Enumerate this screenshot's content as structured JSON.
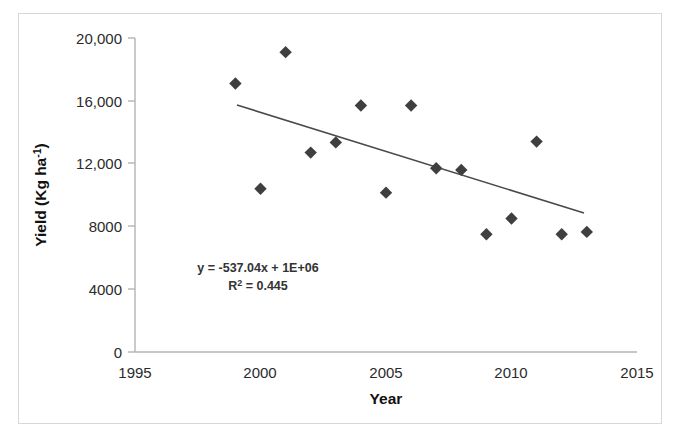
{
  "chart_data": {
    "type": "scatter",
    "title": "",
    "xlabel": "Year",
    "ylabel": "Yield (Kg ha-1)",
    "ylabel_base": "Yield (Kg ha",
    "ylabel_sup": "-1",
    "ylabel_tail": ")",
    "xlim": [
      1995,
      2015
    ],
    "ylim": [
      0,
      20000
    ],
    "xticks": [
      1995,
      2000,
      2005,
      2010,
      2015
    ],
    "xtick_labels": [
      "1995",
      "2000",
      "2005",
      "2010",
      "2015"
    ],
    "yticks": [
      0,
      4000,
      8000,
      12000,
      16000,
      20000
    ],
    "ytick_labels": [
      "0",
      "4000",
      "8000",
      "12,000",
      "16,000",
      "20,000"
    ],
    "grid": false,
    "legend": "none",
    "marker": "diamond",
    "marker_color": "#3f3f3f",
    "trendline_color": "#4a4a4a",
    "x": [
      1999,
      2000,
      2001,
      2002,
      2003,
      2004,
      2005,
      2006,
      2007,
      2008,
      2009,
      2010,
      2011,
      2012,
      2013
    ],
    "values": [
      17100,
      10400,
      19100,
      12700,
      13350,
      15700,
      10150,
      15700,
      11700,
      11600,
      7500,
      8500,
      13400,
      7500,
      7650
    ],
    "points": [
      {
        "x": 1999,
        "y": 17100
      },
      {
        "x": 2000,
        "y": 10400
      },
      {
        "x": 2001,
        "y": 19100
      },
      {
        "x": 2002,
        "y": 12700
      },
      {
        "x": 2003,
        "y": 13350
      },
      {
        "x": 2004,
        "y": 15700
      },
      {
        "x": 2005,
        "y": 10150
      },
      {
        "x": 2006,
        "y": 15700
      },
      {
        "x": 2007,
        "y": 11700
      },
      {
        "x": 2008,
        "y": 11600
      },
      {
        "x": 2009,
        "y": 7500
      },
      {
        "x": 2010,
        "y": 8500
      },
      {
        "x": 2011,
        "y": 13400
      },
      {
        "x": 2012,
        "y": 7500
      },
      {
        "x": 2013,
        "y": 7650
      }
    ],
    "trendline": {
      "equation": "y = -537.04x + 1E+06",
      "r_squared_label": "R",
      "r_squared_sup": "2",
      "r_squared_value": " = 0.445",
      "slope": -537.04,
      "intercept": 1000000,
      "r2": 0.445,
      "x_start": 1999.1,
      "x_end": 2012.85
    },
    "annotations": [
      "y = -537.04x + 1E+06",
      "R2 = 0.445"
    ]
  }
}
